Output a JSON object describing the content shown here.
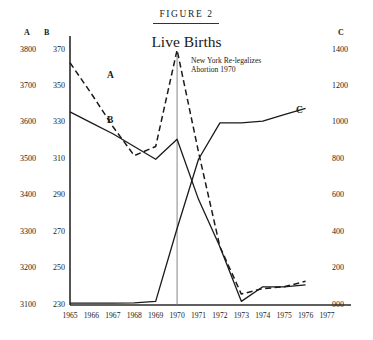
{
  "figure": {
    "number_label": "FIGURE 2",
    "title": "Live Births",
    "annotation": "New York Re-legalizes\nAbortion 1970"
  },
  "axes": {
    "a_header": "A",
    "b_header": "B",
    "c_header": "C"
  },
  "chart_data": {
    "type": "line",
    "title": "Live Births",
    "xlabel": "",
    "ylabel": "",
    "grid": false,
    "legend": "inline-labels",
    "x": [
      1965,
      1966,
      1967,
      1968,
      1969,
      1970,
      1971,
      1972,
      1973,
      1974,
      1975,
      1976
    ],
    "x_axis": {
      "tick_labels": [
        "1965",
        "1966",
        "1967",
        "1968",
        "1969",
        "1970",
        "1971",
        "1972",
        "1973",
        "1974",
        "1975",
        "1976",
        "1977"
      ],
      "range": [
        1965,
        1977
      ]
    },
    "y_axes": [
      {
        "id": "A",
        "side": "left",
        "header": "A",
        "tick_labels": [
          "3800",
          "3700",
          "3600",
          "3500",
          "3400",
          "3300",
          "3200",
          "3100"
        ],
        "values": [
          3800,
          3700,
          3600,
          3500,
          3400,
          3300,
          3200,
          3100
        ],
        "range": [
          3100,
          3800
        ]
      },
      {
        "id": "B",
        "side": "left",
        "header": "B",
        "tick_labels": [
          "370",
          "350",
          "330",
          "310",
          "290",
          "270",
          "250",
          "230"
        ],
        "values": [
          370,
          350,
          330,
          310,
          290,
          270,
          250,
          230
        ],
        "range": [
          230,
          370
        ]
      },
      {
        "id": "C",
        "side": "right",
        "header": "C",
        "tick_labels": [
          "1400",
          "1200",
          "1000",
          "800",
          "600",
          "400",
          "200",
          "000"
        ],
        "values": [
          1400,
          1200,
          1000,
          800,
          600,
          400,
          200,
          0
        ],
        "range": [
          0,
          1400
        ]
      }
    ],
    "series": [
      {
        "name": "A",
        "label": "A",
        "style": "dashed",
        "axis": "A",
        "values": [
          3765,
          3680,
          3590,
          3510,
          3535,
          3800,
          3520,
          3260,
          3130,
          3145,
          3150,
          3165
        ]
      },
      {
        "name": "B",
        "label": "B",
        "style": "solid",
        "axis": "B",
        "values": [
          336,
          330,
          324,
          317,
          310,
          321,
          288,
          262,
          232,
          240,
          240,
          241
        ]
      },
      {
        "name": "C",
        "label": "C",
        "style": "solid",
        "axis": "C",
        "values": [
          10,
          10,
          10,
          12,
          20,
          420,
          800,
          1000,
          1000,
          1010,
          1045,
          1080
        ]
      }
    ],
    "annotations": [
      {
        "text": "New York Re-legalizes Abortion 1970",
        "x": 1970,
        "type": "vertical-marker-line"
      }
    ]
  }
}
